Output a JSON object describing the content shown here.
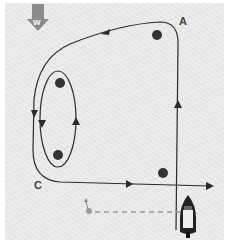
{
  "diagram": {
    "labels": {
      "a": "A",
      "c": "C",
      "wind": "W"
    },
    "colors": {
      "background": "#ececec",
      "path": "#2a2a2a",
      "mark": "#333333",
      "wind_arrow": "#8a8a8a",
      "dashed_line": "#9a9a9a",
      "boat_hull": "#222222"
    },
    "marks": [
      {
        "id": "top-right",
        "x": 157,
        "y": 35
      },
      {
        "id": "upper-left",
        "x": 60,
        "y": 83
      },
      {
        "id": "lower-left",
        "x": 58,
        "y": 155
      },
      {
        "id": "bottom-right",
        "x": 163,
        "y": 173
      }
    ],
    "icons": {
      "wind": "wind-direction-arrow",
      "boat": "motorboat-icon",
      "person": "person-in-water-icon"
    }
  }
}
